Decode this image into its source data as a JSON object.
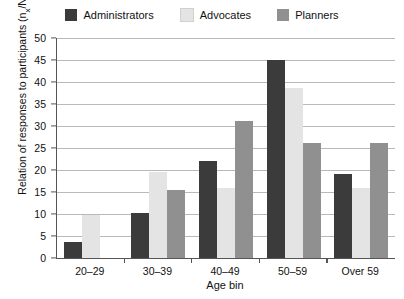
{
  "chart_data": {
    "type": "bar",
    "title": "",
    "xlabel": "Age bin",
    "ylabel": "Relation of responses to participants (n",
    "ylabel_sub": "x",
    "ylabel_tail": "/N) [%]",
    "categories": [
      "20–29",
      "30–39",
      "40–49",
      "50–59",
      "Over 59"
    ],
    "series": [
      {
        "name": "Administrators",
        "color": "#3b3b3b",
        "values": [
          3.7,
          10.2,
          22.0,
          45.0,
          19.0
        ]
      },
      {
        "name": "Advocates",
        "color": "#e4e4e4",
        "values": [
          9.7,
          19.5,
          16.0,
          38.6,
          16.0
        ]
      },
      {
        "name": "Planners",
        "color": "#909090",
        "values": [
          0.0,
          15.5,
          31.2,
          26.2,
          26.2
        ]
      }
    ],
    "ylim": [
      0,
      50
    ],
    "ytick_values": [
      0,
      5,
      10,
      15,
      20,
      25,
      30,
      35,
      40,
      45,
      50
    ],
    "ytick_labels": [
      "0",
      "5",
      "10",
      "15",
      "20",
      "25",
      "30",
      "35",
      "40",
      "45",
      "50"
    ],
    "grid": true,
    "legend_position": "top"
  }
}
